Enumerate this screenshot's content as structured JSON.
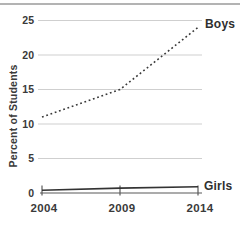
{
  "colors": {
    "background": "#ffffff",
    "top_border": "#b3b3b3",
    "gridline": "#cfcfcf",
    "axis": "#8f8f8f",
    "tick": "#5a5a5a",
    "text": "#3a3a3a"
  },
  "chart_data": {
    "type": "line",
    "title": "",
    "xlabel": "",
    "ylabel": "Percent of Students",
    "x": [
      2004,
      2009,
      2014
    ],
    "xticklabels": [
      "2004",
      "2009",
      "2014"
    ],
    "ylim": [
      0,
      25
    ],
    "yticks": [
      0,
      5,
      10,
      15,
      20,
      25
    ],
    "grid": true,
    "legend_position": "line-end-labels",
    "series": [
      {
        "name": "Boys",
        "values": [
          11,
          15,
          24
        ],
        "line_style": "dotted",
        "color": "#3a3a3a"
      },
      {
        "name": "Girls",
        "values": [
          0.4,
          0.7,
          0.9
        ],
        "line_style": "solid",
        "color": "#333333"
      }
    ]
  }
}
